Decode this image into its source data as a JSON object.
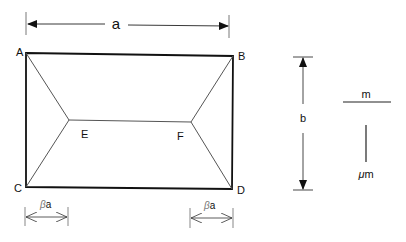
{
  "diagram": {
    "type": "hipped-roof slab yield line pattern",
    "corners": {
      "A": "A",
      "B": "B",
      "C": "C",
      "D": "D"
    },
    "internal_points": {
      "E": "E",
      "F": "F"
    },
    "dimensions": {
      "width_label": "a",
      "height_label": "b",
      "left_offset_label_greek": "β",
      "left_offset_label_var": "a",
      "right_offset_label_greek": "β",
      "right_offset_label_var": "a"
    },
    "legend": {
      "horizontal_moment_label": "m",
      "vertical_moment_label_greek": "μ",
      "vertical_moment_label_var": "m"
    }
  }
}
